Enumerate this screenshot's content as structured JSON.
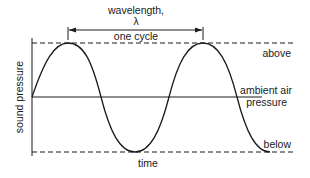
{
  "diagram": {
    "labels": {
      "wavelength": "wavelength,",
      "lambda": "λ",
      "one_cycle": "one cycle",
      "above": "above",
      "ambient_line1": "ambient air",
      "ambient_line2": "pressure",
      "below": "below",
      "x_axis": "time",
      "y_axis": "sound pressure"
    },
    "colors": {
      "line": "#1a1a1a",
      "background": "#ffffff"
    }
  }
}
